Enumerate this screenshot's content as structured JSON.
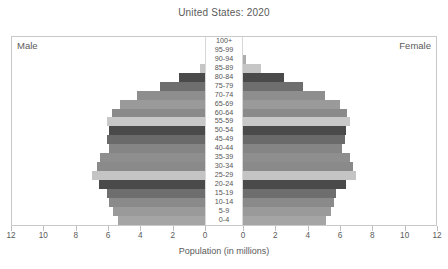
{
  "chart_data": {
    "type": "bar",
    "subtype": "population-pyramid",
    "title": "United States: 2020",
    "xlabel": "Population (in millions)",
    "ylabel": "",
    "left_label": "Male",
    "right_label": "Female",
    "xlim": [
      -12,
      12
    ],
    "xticks": [
      12,
      10,
      8,
      6,
      4,
      2,
      0,
      0,
      2,
      4,
      6,
      8,
      10,
      12
    ],
    "grid": false,
    "legend": "none",
    "categories": [
      "100+",
      "95-99",
      "90-94",
      "85-89",
      "80-84",
      "75-79",
      "70-74",
      "65-69",
      "60-64",
      "55-59",
      "50-54",
      "45-49",
      "40-44",
      "35-39",
      "30-34",
      "25-29",
      "20-24",
      "15-19",
      "10-14",
      "5-9",
      "0-4"
    ],
    "series": [
      {
        "name": "Male",
        "values": [
          0.02,
          0.21,
          0.69,
          1.38,
          2.56,
          3.61,
          4.92,
          5.86,
          6.35,
          6.65,
          6.51,
          6.6,
          6.5,
          7.0,
          7.2,
          7.5,
          7.1,
          6.6,
          6.5,
          6.3,
          6.0
        ]
      },
      {
        "name": "Female",
        "values": [
          0.07,
          0.45,
          1.23,
          2.08,
          3.4,
          4.46,
          5.74,
          6.55,
          6.95,
          7.15,
          6.88,
          6.85,
          6.7,
          7.15,
          7.3,
          7.45,
          6.9,
          6.35,
          6.25,
          6.05,
          5.75
        ]
      }
    ],
    "bar_colors": [
      "#b9b9b9",
      "#9e9e9e",
      "#adadad",
      "#c6c6c6",
      "#4a4a4a",
      "#6e6e6e",
      "#8e8e8e",
      "#9a9a9a",
      "#8a8a8a",
      "#c8c8c8",
      "#4a4a4a",
      "#6a6a6a",
      "#858585",
      "#8e8e8e",
      "#8a8a8a",
      "#c4c4c4",
      "#4a4a4a",
      "#6e6e6e",
      "#8a8a8a",
      "#9a9a9a",
      "#a5a5a5"
    ]
  }
}
